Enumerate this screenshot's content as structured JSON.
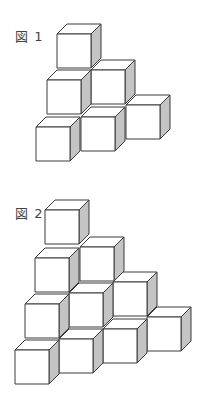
{
  "figures": [
    {
      "label": "図 1",
      "label_pos": [
        15,
        26
      ],
      "cube_size": 34,
      "depth": [
        10,
        -10
      ],
      "cubes_front_top_left": [
        [
          57,
          34
        ],
        [
          91,
          70
        ],
        [
          47,
          80
        ],
        [
          126,
          105
        ],
        [
          81,
          117
        ],
        [
          36,
          127
        ]
      ]
    },
    {
      "label": "図 2",
      "label_pos": [
        15,
        203
      ],
      "cube_size": 34,
      "depth": [
        10,
        -10
      ],
      "cubes_front_top_left": [
        [
          45,
          210
        ],
        [
          80,
          247
        ],
        [
          35,
          258
        ],
        [
          113,
          282
        ],
        [
          69,
          293
        ],
        [
          25,
          304
        ],
        [
          147,
          317
        ],
        [
          103,
          329
        ],
        [
          59,
          339
        ],
        [
          15,
          350
        ]
      ]
    }
  ],
  "colors": {
    "line": "#3a3a3a",
    "face": "#ffffff",
    "side": "#c4c4c4"
  }
}
